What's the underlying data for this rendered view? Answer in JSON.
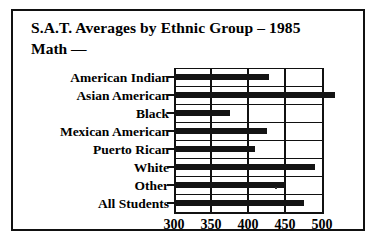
{
  "chart_data": {
    "type": "bar",
    "orientation": "horizontal",
    "title": "S.A.T. Averages by Ethnic Group – 1985",
    "subtitle": "Math —",
    "xlabel": "",
    "ylabel": "",
    "xlim": [
      300,
      500
    ],
    "xticks": [
      300,
      350,
      400,
      450,
      500
    ],
    "xtick_labels": [
      "300",
      "350",
      "400",
      "450",
      "500"
    ],
    "grid": true,
    "legend": false,
    "categories": [
      "American Indian",
      "Asian American",
      "Black",
      "Mexican American",
      "Puerto Rican",
      "White",
      "Other",
      "All Students"
    ],
    "values": [
      428,
      518,
      376,
      426,
      409,
      490,
      450,
      475
    ],
    "bars": [
      {
        "label": "American Indian",
        "value": 428
      },
      {
        "label": "Asian American",
        "value": 518
      },
      {
        "label": "Black",
        "value": 376
      },
      {
        "label": "Mexican American",
        "value": 426
      },
      {
        "label": "Puerto Rican",
        "value": 409
      },
      {
        "label": "White",
        "value": 490
      },
      {
        "label": "Other",
        "value": 450
      },
      {
        "label": "All Students",
        "value": 475
      }
    ],
    "colors": {
      "bar": "#141414",
      "axis": "#111111",
      "background": "#ffffff",
      "text": "#000000"
    }
  }
}
